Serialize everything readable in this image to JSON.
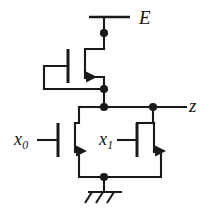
{
  "figure": {
    "kind": "circuit-schematic",
    "background_color": "#ffffff",
    "line_color": "#1a1a1a"
  },
  "labels": {
    "supply": {
      "text": "E",
      "name": "supply-label"
    },
    "output": {
      "text": "z",
      "name": "output-label"
    },
    "input0": {
      "base": "x",
      "sub": "0",
      "name": "input-x0-label"
    },
    "input1": {
      "base": "x",
      "sub": "1",
      "name": "input-x1-label"
    }
  },
  "nodes": [
    {
      "name": "supply-node-dot",
      "x": 104,
      "y": 33
    },
    {
      "name": "load-source-node-dot",
      "x": 104,
      "y": 89
    },
    {
      "name": "output-node-dot",
      "x": 104,
      "y": 107
    },
    {
      "name": "output-branch-dot",
      "x": 153,
      "y": 107
    },
    {
      "name": "ground-node-dot",
      "x": 104,
      "y": 177
    }
  ],
  "transistors": [
    {
      "name": "load-transistor",
      "role": "load",
      "gate_signal": "",
      "gate_bar_x": 68,
      "gate_top_y": 49,
      "gate_bottom_y": 83
    },
    {
      "name": "pulldown-transistor-x0",
      "role": "pull-down",
      "gate_signal": "x0",
      "gate_bar_x": 58,
      "gate_top_y": 123,
      "gate_bottom_y": 157
    },
    {
      "name": "pulldown-transistor-x1",
      "role": "pull-down",
      "gate_signal": "x1",
      "gate_bar_x": 137,
      "gate_top_y": 123,
      "gate_bottom_y": 157
    }
  ],
  "ground": {
    "name": "chassis-ground-symbol",
    "bar_y": 192,
    "bar_x1": 88,
    "bar_x2": 122,
    "hatch_count": 3
  }
}
